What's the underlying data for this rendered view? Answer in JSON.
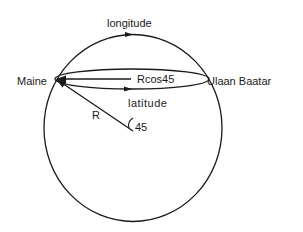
{
  "diagram": {
    "labels": {
      "longitude": "longitude",
      "maine": "Maine",
      "ulaan_baatar": "Ulaan Baatar",
      "rcos": "Rcos45",
      "latitude": "latitude",
      "radius": "R",
      "angle": "45"
    },
    "colors": {
      "stroke": "#1a1a1a",
      "background": "#ffffff"
    }
  }
}
